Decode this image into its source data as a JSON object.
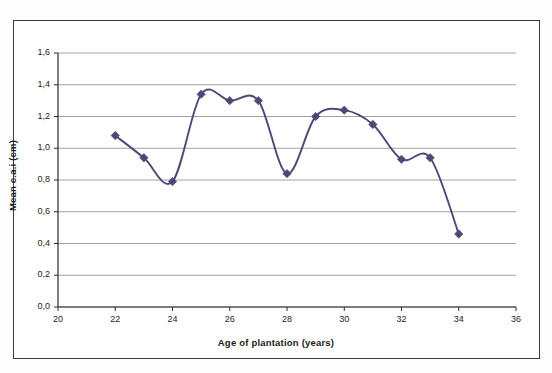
{
  "figure": {
    "background_color": "#ffffff",
    "frame_color": "#3a3a3a"
  },
  "chart_data": {
    "type": "line",
    "title": "",
    "subtitle": "",
    "xlabel": "Age of plantation (years)",
    "ylabel": "Mean c.a.i (cm)",
    "xlim": [
      20,
      36
    ],
    "ylim": [
      0.0,
      1.6
    ],
    "xticks": [
      20,
      22,
      24,
      26,
      28,
      30,
      32,
      34,
      36
    ],
    "yticks": [
      0.0,
      0.2,
      0.4,
      0.6,
      0.8,
      1.0,
      1.2,
      1.4,
      1.6
    ],
    "xtick_labels": [
      "20",
      "22",
      "24",
      "26",
      "28",
      "30",
      "32",
      "34",
      "36"
    ],
    "ytick_labels": [
      "0,0",
      "0,2",
      "0,4",
      "0,6",
      "0,8",
      "1,0",
      "1,2",
      "1,4",
      "1,6"
    ],
    "decimal_separator": ",",
    "grid": {
      "horizontal": true,
      "vertical": false,
      "color": "#8a8a8a"
    },
    "legend": {
      "visible": false,
      "position": "none"
    },
    "smoothing": "spline",
    "marker": "diamond",
    "series": [
      {
        "name": "Mean c.a.i",
        "color": "#4a4a77",
        "line_width": 1.9,
        "marker_size": 4.2,
        "x": [
          22,
          23,
          24,
          25,
          26,
          27,
          28,
          29,
          30,
          31,
          32,
          33,
          34
        ],
        "values": [
          1.08,
          0.94,
          0.79,
          1.34,
          1.3,
          1.3,
          0.84,
          1.2,
          1.24,
          1.15,
          0.93,
          0.94,
          0.46
        ]
      }
    ],
    "annotations": []
  },
  "axes": {
    "x_title": "Age of plantation (years)",
    "y_title": "Mean c.a.i (cm)"
  }
}
